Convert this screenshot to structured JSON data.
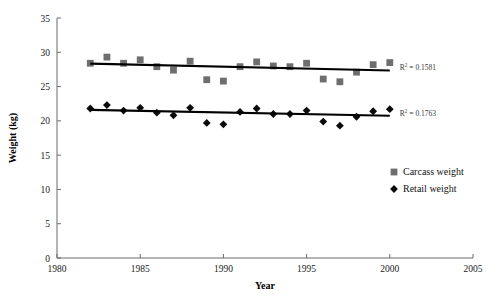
{
  "chart_data": {
    "type": "scatter",
    "title": "",
    "xlabel": "Year",
    "ylabel": "Weight (kg)",
    "xlim": [
      1980,
      2005
    ],
    "ylim": [
      0,
      35
    ],
    "xticks": [
      1980,
      1985,
      1990,
      1995,
      2000,
      2005
    ],
    "xtick_labels": [
      "1980",
      "1985",
      "1990",
      "1995",
      "2000",
      "2005"
    ],
    "yticks": [
      0,
      5,
      10,
      15,
      20,
      25,
      30,
      35
    ],
    "ytick_labels": [
      "0",
      "5",
      "10",
      "15",
      "20",
      "25",
      "30",
      "35"
    ],
    "grid": false,
    "legend_position": "lower-right",
    "series": [
      {
        "name": "Carcass weight",
        "marker": "square",
        "color": "#6e6e6e",
        "x": [
          1982,
          1983,
          1984,
          1985,
          1986,
          1987,
          1988,
          1989,
          1990,
          1991,
          1992,
          1993,
          1994,
          1995,
          1996,
          1997,
          1998,
          1999,
          2000
        ],
        "values": [
          28.4,
          29.3,
          28.4,
          28.9,
          27.9,
          27.4,
          28.7,
          26.0,
          25.8,
          27.9,
          28.6,
          28.0,
          27.9,
          28.4,
          26.1,
          25.7,
          27.1,
          28.2,
          28.5
        ]
      },
      {
        "name": "Retail weight",
        "marker": "diamond",
        "color": "#0b0b0b",
        "x": [
          1982,
          1983,
          1984,
          1985,
          1986,
          1987,
          1988,
          1989,
          1990,
          1991,
          1992,
          1993,
          1994,
          1995,
          1996,
          1997,
          1998,
          1999,
          2000
        ],
        "values": [
          21.8,
          22.3,
          21.5,
          21.9,
          21.2,
          20.8,
          21.9,
          19.7,
          19.5,
          21.3,
          21.8,
          21.0,
          21.0,
          21.5,
          19.9,
          19.3,
          20.6,
          21.4,
          21.7
        ]
      }
    ],
    "trendlines": [
      {
        "series": "Carcass weight",
        "x_start": 1982,
        "x_end": 2000,
        "y_start": 28.35,
        "y_end": 27.35,
        "r_squared": 0.1581,
        "r2_label": "R",
        "r2_exponent": "2",
        "r2_text": " = 0.1581"
      },
      {
        "series": "Retail weight",
        "x_start": 1982,
        "x_end": 2000,
        "y_start": 21.6,
        "y_end": 20.75,
        "r_squared": 0.1763,
        "r2_label": "R",
        "r2_exponent": "2",
        "r2_text": " = 0.1763"
      }
    ],
    "legend": [
      {
        "label": "Carcass weight",
        "marker": "square",
        "color": "#6e6e6e"
      },
      {
        "label": "Retail weight",
        "marker": "diamond",
        "color": "#0b0b0b"
      }
    ]
  }
}
